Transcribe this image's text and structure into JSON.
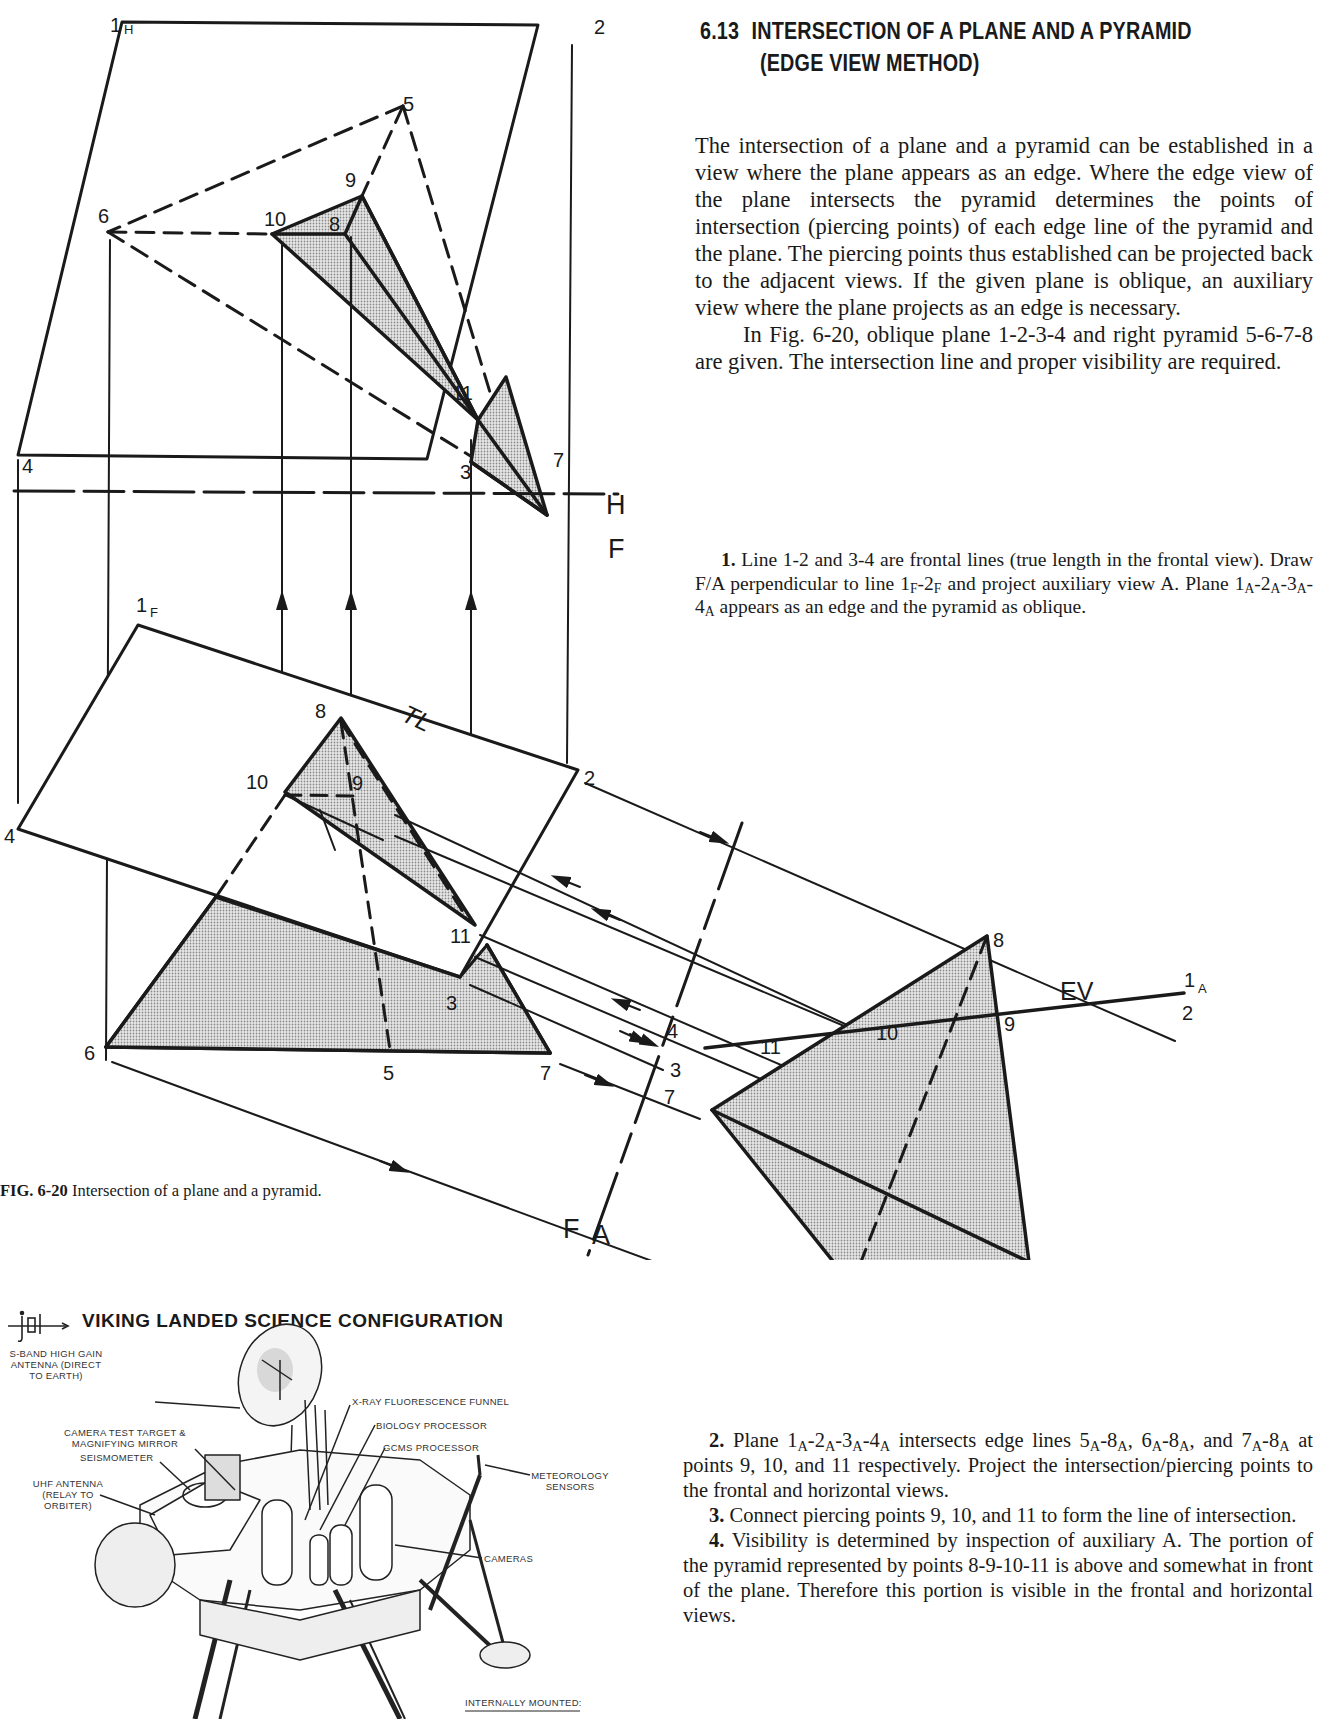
{
  "section": {
    "number": "6.13",
    "title_line1": "INTERSECTION OF A PLANE AND A PYRAMID",
    "title_line2": "(EDGE VIEW METHOD)"
  },
  "intro": {
    "paragraph1": "The intersection of a plane and a pyramid can be established in a view where the plane appears as an edge. Where the edge view of the plane intersects the pyramid determines the points of intersection (piercing points) of each edge line of the pyramid and the plane. The piercing points thus established can be projected back to the adjacent views. If the given plane is oblique, an auxiliary view where the plane projects as an edge is necessary.",
    "paragraph2": "In Fig. 6-20, oblique plane 1-2-3-4 and right pyramid 5-6-7-8 are given. The intersection line and proper visibility are required."
  },
  "steps": {
    "step1": {
      "number": "1.",
      "text_a": " Line 1-2 and 3-4 are frontal lines (true length in the frontal view). Draw F/A perpendicular to line 1",
      "sub_F1": "F",
      "text_b": "-2",
      "sub_F2": "F",
      "text_c": " and project auxiliary view A. Plane 1",
      "sub_A1": "A",
      "text_d": "-2",
      "sub_A2": "A",
      "text_e": "-3",
      "sub_A3": "A",
      "text_f": "-4",
      "sub_A4": "A",
      "text_g": " appears as an edge and the pyramid as oblique."
    },
    "step2": {
      "number": "2.",
      "text_a": " Plane 1",
      "s1": "A",
      "t1": "-2",
      "s2": "A",
      "t2": "-3",
      "s3": "A",
      "t3": "-4",
      "s4": "A",
      "t4": " intersects edge lines 5",
      "s5": "A",
      "t5": "-8",
      "s6": "A",
      "t6": ", 6",
      "s7": "A",
      "t7": "-8",
      "s8": "A",
      "t8": ", and 7",
      "s9": "A",
      "t9": "-8",
      "s10": "A",
      "t10": " at points 9, 10, and 11 respectively. Project the intersection/piercing points to the frontal and horizontal views."
    },
    "step3": {
      "number": "3.",
      "text": " Connect piercing points 9, 10, and 11 to form the line of intersection."
    },
    "step4": {
      "number": "4.",
      "text": " Visibility is determined by inspection of auxiliary A. The portion of the pyramid represented by points 8-9-10-11 is above and somewhat in front of the plane. Therefore this portion is visible in the frontal and horizontal views."
    }
  },
  "figure": {
    "caption_label": "FIG. 6-20",
    "caption_text": "Intersection of a plane and a pyramid.",
    "colors": {
      "line": "#1a1a1a",
      "shade": "#cfcfcf"
    },
    "fold_lines": {
      "hf_upper": "H",
      "hf_lower": "F",
      "fa_left": "F",
      "fa_right": "A"
    },
    "annotations": {
      "true_length": "TL",
      "edge_view": "EV"
    },
    "horizontal_view": {
      "labels": {
        "p1": "1",
        "p1_sub": "H",
        "p2": "2",
        "p3": "3",
        "p4": "4",
        "p5": "5",
        "p6": "6",
        "p7": "7",
        "p8": "8",
        "p9": "9",
        "p10": "10",
        "p11": "11"
      }
    },
    "frontal_view": {
      "labels": {
        "p1": "1",
        "p1_sub": "F",
        "p2": "2",
        "p3": "3",
        "p4": "4",
        "p5": "5",
        "p6": "6",
        "p7": "7",
        "p8": "8",
        "p9": "9",
        "p10": "10",
        "p11": "11"
      }
    },
    "auxiliary_view": {
      "labels": {
        "p1": "1",
        "p1_sub": "A",
        "p2": "2",
        "p3": "3",
        "p4": "4",
        "p5": "5",
        "p6": "6",
        "p7": "7",
        "p8": "8",
        "p9": "9",
        "p10": "10",
        "p11": "11"
      }
    }
  },
  "viking": {
    "title": "VIKING LANDED SCIENCE CONFIGURATION",
    "logo": "jpl-logo-icon",
    "labels": {
      "antenna_high_gain_l1": "S-BAND HIGH GAIN",
      "antenna_high_gain_l2": "ANTENNA (DIRECT",
      "antenna_high_gain_l3": "TO EARTH)",
      "camera_target_l1": "CAMERA TEST TARGET &",
      "camera_target_l2": "MAGNIFYING MIRROR",
      "seismometer": "SEISMOMETER",
      "uhf_l1": "UHF ANTENNA",
      "uhf_l2": "(RELAY TO",
      "uhf_l3": "ORBITER)",
      "xray": "X-RAY FLUORESCENCE FUNNEL",
      "biology": "BIOLOGY PROCESSOR",
      "gcms": "GCMS PROCESSOR",
      "meteorology_l1": "METEOROLOGY",
      "meteorology_l2": "SENSORS",
      "cameras": "CAMERAS",
      "internally_mounted": "INTERNALLY MOUNTED:"
    }
  }
}
